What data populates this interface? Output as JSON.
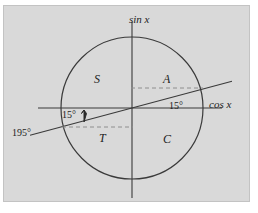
{
  "figure": {
    "background_color": "#ffffff",
    "plate_color": "#d9d9d9",
    "plate_border_color": "#c3c3c3",
    "stroke_color": "#3a3a3a",
    "dash_color": "#8e8e8e",
    "text_color": "#1d1d1d"
  },
  "geometry": {
    "center_x": 132,
    "center_y": 108,
    "radius": 71,
    "angle_degrees": 15,
    "vertical_axis_top_y": 22,
    "vertical_axis_bottom_y": 198,
    "horizontal_axis_left_x": 38,
    "horizontal_axis_right_x": 222,
    "terminal_line_left_x": 30,
    "terminal_line_right_x": 232,
    "dash_upper_y": 88,
    "dash_lower_y": 127
  },
  "labels": {
    "sin_axis": "sin x",
    "cos_axis": "cos x",
    "angle_right": "15°",
    "angle_left": "15°",
    "angle_reflex": "195°",
    "quadrant_sine": "S",
    "quadrant_all": "A",
    "quadrant_tangent": "T",
    "quadrant_cosine": "C"
  }
}
